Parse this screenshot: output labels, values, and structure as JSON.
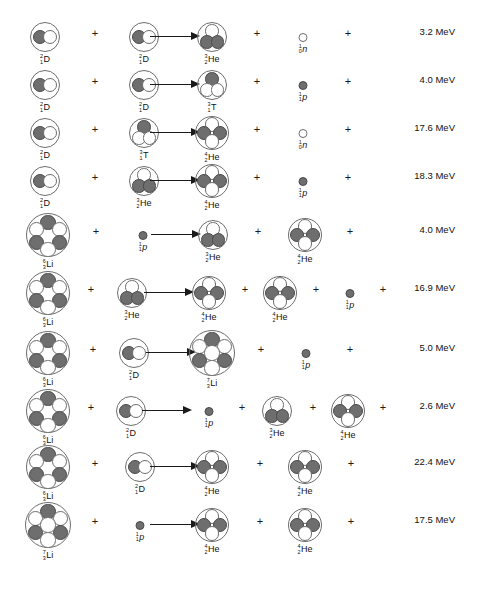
{
  "figure": {
    "energy_unit": "MeV",
    "colors": {
      "proton": "#6e6e6e",
      "neutron": "#ffffff",
      "outline": "#6d6d6d",
      "text": "#111111",
      "background": "#ffffff"
    },
    "plus_symbol": "+",
    "arrow_symbol": "arrow-right"
  },
  "species": {
    "D": {
      "A": "2",
      "Z": "1",
      "symbol": "D",
      "italic": false,
      "kind": "nucleus",
      "size": 30,
      "layout": "deuteron",
      "nucleons": [
        "p",
        "n"
      ]
    },
    "T": {
      "A": "3",
      "Z": "1",
      "symbol": "T",
      "italic": false,
      "kind": "nucleus",
      "size": 30,
      "layout": "triton",
      "nucleons": [
        "p",
        "n",
        "n"
      ]
    },
    "He3": {
      "A": "3",
      "Z": "2",
      "symbol": "He",
      "italic": false,
      "kind": "nucleus",
      "size": 30,
      "layout": "triton",
      "nucleons": [
        "n",
        "p",
        "p"
      ]
    },
    "He4": {
      "A": "4",
      "Z": "2",
      "symbol": "He",
      "italic": false,
      "kind": "nucleus",
      "size": 34,
      "layout": "alpha",
      "nucleons": [
        "n",
        "p",
        "p",
        "n"
      ]
    },
    "Li6": {
      "A": "6",
      "Z": "3",
      "symbol": "Li",
      "italic": false,
      "kind": "nucleus",
      "size": 44,
      "layout": "hex6",
      "nucleons": [
        "p",
        "n",
        "n",
        "p",
        "p",
        "n"
      ]
    },
    "Li7": {
      "A": "7",
      "Z": "3",
      "symbol": "Li",
      "italic": false,
      "kind": "nucleus",
      "size": 46,
      "layout": "hex7",
      "nucleons": [
        "p",
        "n",
        "n",
        "p",
        "p",
        "n",
        "n"
      ]
    },
    "p": {
      "A": "1",
      "Z": "1",
      "symbol": "p",
      "italic": true,
      "kind": "bare",
      "size": 9,
      "layout": "bare",
      "nucleons": [
        "p"
      ]
    },
    "n": {
      "A": "1",
      "Z": "0",
      "symbol": "n",
      "italic": true,
      "kind": "bare",
      "size": 9,
      "layout": "bare",
      "nucleons": [
        "n"
      ]
    }
  },
  "reactions": [
    {
      "id": "dd-he3-n",
      "y": 14,
      "energy": "3.2 MeV",
      "items": [
        {
          "type": "species",
          "key": "D",
          "x": 45
        },
        {
          "type": "plus",
          "x": 95
        },
        {
          "type": "species",
          "key": "D",
          "x": 144
        },
        {
          "type": "arrow",
          "x": 176
        },
        {
          "type": "species",
          "key": "He3",
          "x": 212
        },
        {
          "type": "plus",
          "x": 257
        },
        {
          "type": "species",
          "key": "n",
          "x": 303
        },
        {
          "type": "plus",
          "x": 348
        }
      ]
    },
    {
      "id": "dd-t-p",
      "y": 62,
      "energy": "4.0 MeV",
      "items": [
        {
          "type": "species",
          "key": "D",
          "x": 45
        },
        {
          "type": "plus",
          "x": 95
        },
        {
          "type": "species",
          "key": "D",
          "x": 144
        },
        {
          "type": "arrow",
          "x": 176
        },
        {
          "type": "species",
          "key": "T",
          "x": 212
        },
        {
          "type": "plus",
          "x": 257
        },
        {
          "type": "species",
          "key": "p",
          "x": 303
        },
        {
          "type": "plus",
          "x": 348
        }
      ]
    },
    {
      "id": "dt-he4-n",
      "y": 110,
      "energy": "17.6 MeV",
      "items": [
        {
          "type": "species",
          "key": "D",
          "x": 45
        },
        {
          "type": "plus",
          "x": 95
        },
        {
          "type": "species",
          "key": "T",
          "x": 144
        },
        {
          "type": "arrow",
          "x": 176
        },
        {
          "type": "species",
          "key": "He4",
          "x": 212
        },
        {
          "type": "plus",
          "x": 257
        },
        {
          "type": "species",
          "key": "n",
          "x": 303
        },
        {
          "type": "plus",
          "x": 348
        }
      ]
    },
    {
      "id": "dhe3-he4-p",
      "y": 158,
      "energy": "18.3 MeV",
      "items": [
        {
          "type": "species",
          "key": "D",
          "x": 45
        },
        {
          "type": "plus",
          "x": 95
        },
        {
          "type": "species",
          "key": "He3",
          "x": 144
        },
        {
          "type": "arrow",
          "x": 176
        },
        {
          "type": "species",
          "key": "He4",
          "x": 212
        },
        {
          "type": "plus",
          "x": 257
        },
        {
          "type": "species",
          "key": "p",
          "x": 303
        },
        {
          "type": "plus",
          "x": 348
        }
      ]
    },
    {
      "id": "li6p-he3-he4",
      "y": 212,
      "energy": "4.0 MeV",
      "items": [
        {
          "type": "species",
          "key": "Li6",
          "x": 48
        },
        {
          "type": "plus",
          "x": 96
        },
        {
          "type": "species",
          "key": "p",
          "x": 143
        },
        {
          "type": "arrow",
          "x": 177
        },
        {
          "type": "species",
          "key": "He3",
          "x": 213
        },
        {
          "type": "plus",
          "x": 258
        },
        {
          "type": "species",
          "key": "He4",
          "x": 305
        },
        {
          "type": "plus",
          "x": 350
        }
      ]
    },
    {
      "id": "li6he3-he4-he4-p",
      "y": 270,
      "energy": "16.9 MeV",
      "items": [
        {
          "type": "species",
          "key": "Li6",
          "x": 48
        },
        {
          "type": "plus",
          "x": 91
        },
        {
          "type": "species",
          "key": "He3",
          "x": 132
        },
        {
          "type": "arrow",
          "x": 170
        },
        {
          "type": "species",
          "key": "He4",
          "x": 209
        },
        {
          "type": "plus",
          "x": 245
        },
        {
          "type": "species",
          "key": "He4",
          "x": 280
        },
        {
          "type": "plus",
          "x": 316
        },
        {
          "type": "species",
          "key": "p",
          "x": 350
        },
        {
          "type": "plus",
          "x": 383
        }
      ]
    },
    {
      "id": "li6d-li7-p",
      "y": 330,
      "energy": "5.0 MeV",
      "items": [
        {
          "type": "species",
          "key": "Li6",
          "x": 48
        },
        {
          "type": "plus",
          "x": 93
        },
        {
          "type": "species",
          "key": "D",
          "x": 134
        },
        {
          "type": "arrow",
          "x": 172
        },
        {
          "type": "species",
          "key": "Li7",
          "x": 212
        },
        {
          "type": "plus",
          "x": 261
        },
        {
          "type": "species",
          "key": "p",
          "x": 306
        },
        {
          "type": "plus",
          "x": 350
        }
      ]
    },
    {
      "id": "li6d-p-he3-he4",
      "y": 388,
      "energy": "2.6 MeV",
      "items": [
        {
          "type": "species",
          "key": "Li6",
          "x": 48
        },
        {
          "type": "plus",
          "x": 91
        },
        {
          "type": "species",
          "key": "D",
          "x": 131
        },
        {
          "type": "arrow",
          "x": 168
        },
        {
          "type": "species",
          "key": "p",
          "x": 209
        },
        {
          "type": "plus",
          "x": 242
        },
        {
          "type": "species",
          "key": "He3",
          "x": 277
        },
        {
          "type": "plus",
          "x": 313
        },
        {
          "type": "species",
          "key": "He4",
          "x": 348
        },
        {
          "type": "plus",
          "x": 383
        }
      ]
    },
    {
      "id": "li6d-he4-he4",
      "y": 444,
      "energy": "22.4 MeV",
      "items": [
        {
          "type": "species",
          "key": "Li6",
          "x": 48
        },
        {
          "type": "plus",
          "x": 95
        },
        {
          "type": "species",
          "key": "D",
          "x": 140
        },
        {
          "type": "arrow",
          "x": 176
        },
        {
          "type": "species",
          "key": "He4",
          "x": 212
        },
        {
          "type": "plus",
          "x": 260
        },
        {
          "type": "species",
          "key": "He4",
          "x": 305
        },
        {
          "type": "plus",
          "x": 351
        }
      ]
    },
    {
      "id": "li7p-he4-he4",
      "y": 502,
      "energy": "17.5 MeV",
      "items": [
        {
          "type": "species",
          "key": "Li7",
          "x": 48
        },
        {
          "type": "plus",
          "x": 95
        },
        {
          "type": "species",
          "key": "p",
          "x": 140
        },
        {
          "type": "arrow",
          "x": 176
        },
        {
          "type": "species",
          "key": "He4",
          "x": 212
        },
        {
          "type": "plus",
          "x": 260
        },
        {
          "type": "species",
          "key": "He4",
          "x": 305
        },
        {
          "type": "plus",
          "x": 351
        }
      ]
    }
  ],
  "energy_column_x": 455
}
